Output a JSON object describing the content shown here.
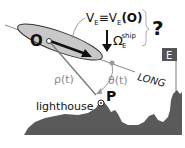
{
  "diagram": {
    "labels": {
      "origin": "O",
      "velocity": "V",
      "velocity_sub": "E",
      "equiv": "≡",
      "velocity2": "V",
      "velocity2_sub": "E",
      "velocity2_arg": "(O)",
      "omega": "Ω",
      "omega_sub": "E",
      "omega_sup": "ship",
      "question": "?",
      "long": "LONG",
      "rho": "ρ(t)",
      "theta": "θ(t)",
      "point": "P",
      "lighthouse": "lighthouse",
      "east": "E"
    },
    "colors": {
      "ellipse_fill": "#c8c8c8",
      "coast": "#5a5a5a",
      "line": "#888888",
      "text": "#111111",
      "east_box": "#555555",
      "dot": "#999999"
    }
  }
}
